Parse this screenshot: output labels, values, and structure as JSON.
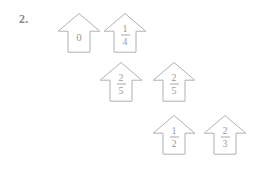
{
  "page": {
    "background_color": "#ffffff",
    "stroke_color": "#b0b0b0",
    "text_color": "#9a9a9a",
    "number_color": "#8a8a8a"
  },
  "exercise": {
    "item_number": "2."
  },
  "houses": [
    {
      "name": "house-zero",
      "kind": "whole",
      "value": "0",
      "numerator": "",
      "denominator": "",
      "x": 57,
      "y": 12
    },
    {
      "name": "house-one-fourth",
      "kind": "fraction",
      "value": "1/4",
      "numerator": "1",
      "denominator": "4",
      "x": 103,
      "y": 12
    },
    {
      "name": "house-two-fifths-a",
      "kind": "fraction",
      "value": "2/5",
      "numerator": "2",
      "denominator": "5",
      "x": 99,
      "y": 61
    },
    {
      "name": "house-two-fifths-b",
      "kind": "fraction",
      "value": "2/5",
      "numerator": "2",
      "denominator": "5",
      "x": 152,
      "y": 61
    },
    {
      "name": "house-one-half",
      "kind": "fraction",
      "value": "1/2",
      "numerator": "1",
      "denominator": "2",
      "x": 152,
      "y": 114
    },
    {
      "name": "house-two-thirds",
      "kind": "fraction",
      "value": "2/3",
      "numerator": "2",
      "denominator": "3",
      "x": 203,
      "y": 114
    }
  ]
}
